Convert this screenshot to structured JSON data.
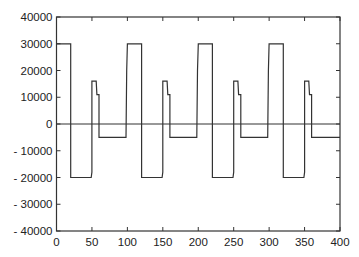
{
  "chart_data": {
    "type": "line",
    "title": "",
    "xlabel": "",
    "ylabel": "",
    "xlim": [
      0,
      400
    ],
    "ylim": [
      -40000,
      40000
    ],
    "grid": false,
    "legend": null,
    "x_ticks": [
      0,
      50,
      100,
      150,
      200,
      250,
      300,
      350,
      400
    ],
    "y_ticks": [
      40000,
      30000,
      20000,
      10000,
      0,
      -10000,
      -20000,
      -30000,
      -40000
    ],
    "y_tick_labels": [
      "40000",
      "30000",
      "20000",
      "10000",
      "0",
      "- 10000",
      "- 20000",
      "- 30000",
      "- 40000"
    ],
    "zero_line": true,
    "series": [
      {
        "name": "signal",
        "color": "#333333",
        "step_period": 100,
        "points": [
          [
            0,
            30000
          ],
          [
            20,
            30000
          ],
          [
            20,
            -20000
          ],
          [
            49,
            -20000
          ],
          [
            50,
            -18000
          ],
          [
            50,
            16000
          ],
          [
            56,
            16000
          ],
          [
            57,
            11000
          ],
          [
            60,
            11000
          ],
          [
            60,
            -5000
          ],
          [
            98,
            -5000
          ],
          [
            99,
            20000
          ],
          [
            100,
            30000
          ],
          [
            120,
            30000
          ],
          [
            120,
            -20000
          ],
          [
            149,
            -20000
          ],
          [
            150,
            -18000
          ],
          [
            150,
            16000
          ],
          [
            156,
            16000
          ],
          [
            157,
            11000
          ],
          [
            160,
            11000
          ],
          [
            160,
            -5000
          ],
          [
            198,
            -5000
          ],
          [
            199,
            20000
          ],
          [
            200,
            30000
          ],
          [
            220,
            30000
          ],
          [
            220,
            -20000
          ],
          [
            249,
            -20000
          ],
          [
            250,
            -18000
          ],
          [
            250,
            16000
          ],
          [
            256,
            16000
          ],
          [
            257,
            11000
          ],
          [
            260,
            11000
          ],
          [
            260,
            -5000
          ],
          [
            298,
            -5000
          ],
          [
            299,
            20000
          ],
          [
            300,
            30000
          ],
          [
            320,
            30000
          ],
          [
            320,
            -20000
          ],
          [
            349,
            -20000
          ],
          [
            350,
            -18000
          ],
          [
            350,
            16000
          ],
          [
            356,
            16000
          ],
          [
            357,
            11000
          ],
          [
            360,
            11000
          ],
          [
            360,
            -5000
          ],
          [
            400,
            -5000
          ]
        ]
      }
    ]
  }
}
